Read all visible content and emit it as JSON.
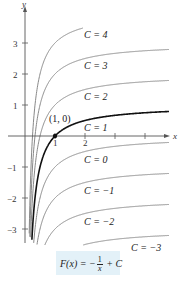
{
  "chart_data": {
    "type": "line",
    "title": "",
    "xlabel": "x",
    "ylabel": "y",
    "xlim": [
      -0.8,
      4.8
    ],
    "ylim": [
      -3.5,
      3.9
    ],
    "x_ticks": [
      1,
      2,
      3,
      4
    ],
    "x_tick_labels": [
      "1",
      "2"
    ],
    "y_ticks": [
      -3,
      -2,
      -1,
      1,
      2,
      3
    ],
    "y_tick_labels": [
      "-3",
      "-2",
      "-1",
      "1",
      "2",
      "3"
    ],
    "grid": false,
    "function": "F(x) = -1/x + C",
    "series": [
      {
        "name": "C = 4",
        "C": 4,
        "color": "#888888"
      },
      {
        "name": "C = 3",
        "C": 3,
        "color": "#888888"
      },
      {
        "name": "C = 2",
        "C": 2,
        "color": "#888888"
      },
      {
        "name": "C = 1",
        "C": 1,
        "color": "#111111",
        "highlighted": true
      },
      {
        "name": "C = 0",
        "C": 0,
        "color": "#888888"
      },
      {
        "name": "C = -1",
        "C": -1,
        "color": "#888888"
      },
      {
        "name": "C = -2",
        "C": -2,
        "color": "#888888"
      },
      {
        "name": "C = -3",
        "C": -3,
        "color": "#888888"
      }
    ],
    "annotations": [
      {
        "text": "(1, 0)",
        "x": 1,
        "y": 0,
        "type": "point"
      }
    ]
  },
  "labels": {
    "x_axis": "x",
    "y_axis": "y",
    "point": "(1, 0)",
    "x1": "1",
    "x2": "2",
    "y3": "3",
    "y2": "2",
    "y1": "1",
    "ym1": "−1",
    "ym2": "−2",
    "ym3": "−3",
    "curves": [
      "C = 4",
      "C = 3",
      "C = 2",
      "C = 1",
      "C = 0",
      "C = −1",
      "C = −2",
      "C = −3"
    ]
  },
  "formula": {
    "lhs": "F(x) = −",
    "num": "1",
    "den": "x",
    "rhs": "+ C"
  },
  "colors": {
    "formula_bg": "#e3f1f8",
    "curve": "#888888",
    "highlight": "#111111"
  }
}
